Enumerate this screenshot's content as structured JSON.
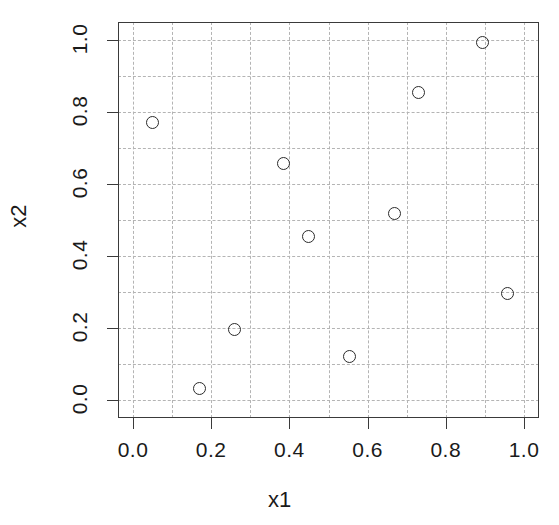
{
  "chart_data": {
    "type": "scatter",
    "title": "",
    "xlabel": "x1",
    "ylabel": "x2",
    "xlim": [
      -0.04,
      1.04
    ],
    "ylim": [
      -0.045,
      1.045
    ],
    "xticks": [
      "0.0",
      "0.2",
      "0.4",
      "0.6",
      "0.8",
      "1.0"
    ],
    "xtick_values": [
      0.0,
      0.2,
      0.4,
      0.6,
      0.8,
      1.0
    ],
    "yticks": [
      "0.0",
      "0.2",
      "0.4",
      "0.6",
      "0.8",
      "1.0"
    ],
    "ytick_values": [
      0.0,
      0.2,
      0.4,
      0.6,
      0.8,
      1.0
    ],
    "grid": true,
    "grid_style": "dashed",
    "grid_color": "#b4b4b4",
    "grid_x_values": [
      0.0,
      0.1,
      0.2,
      0.3,
      0.4,
      0.5,
      0.6,
      0.7,
      0.8,
      0.9,
      1.0
    ],
    "grid_y_values": [
      0.0,
      0.1,
      0.2,
      0.3,
      0.4,
      0.5,
      0.6,
      0.7,
      0.8,
      0.9,
      1.0
    ],
    "legend": null,
    "marker": "open-circle",
    "marker_color": "#2b2b2b",
    "axis_color": "#3a3a3a",
    "background": "#ffffff",
    "x": [
      0.05,
      0.17,
      0.26,
      0.386,
      0.448,
      0.553,
      0.67,
      0.729,
      0.895,
      0.959
    ],
    "y": [
      0.77,
      0.033,
      0.196,
      0.658,
      0.455,
      0.122,
      0.519,
      0.853,
      0.992,
      0.297
    ],
    "points": [
      {
        "x": 0.05,
        "y": 0.77
      },
      {
        "x": 0.17,
        "y": 0.033
      },
      {
        "x": 0.26,
        "y": 0.196
      },
      {
        "x": 0.386,
        "y": 0.658
      },
      {
        "x": 0.448,
        "y": 0.455
      },
      {
        "x": 0.553,
        "y": 0.122
      },
      {
        "x": 0.67,
        "y": 0.519
      },
      {
        "x": 0.729,
        "y": 0.853
      },
      {
        "x": 0.895,
        "y": 0.992
      },
      {
        "x": 0.959,
        "y": 0.297
      }
    ]
  }
}
